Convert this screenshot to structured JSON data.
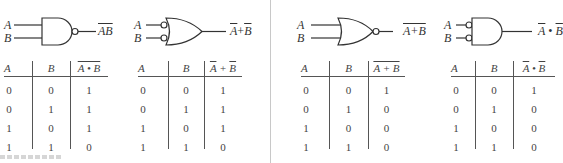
{
  "diagrams": [
    {
      "gate": "NAND",
      "input_a": "A",
      "input_b": "B",
      "output_expr": "AB",
      "output_style": "overline-whole",
      "table": {
        "headers": [
          "A",
          "B",
          "A • B"
        ],
        "rows": [
          [
            "0",
            "0",
            "1"
          ],
          [
            "0",
            "1",
            "1"
          ],
          [
            "1",
            "0",
            "1"
          ],
          [
            "1",
            "1",
            "0"
          ]
        ]
      }
    },
    {
      "gate": "OR with inverted inputs",
      "input_a": "A",
      "input_b": "B",
      "output_expr_parts": [
        "A",
        "+",
        "B"
      ],
      "output_style": "overline-each",
      "table": {
        "headers": [
          "A",
          "B",
          "A + B"
        ],
        "rows": [
          [
            "0",
            "0",
            "1"
          ],
          [
            "0",
            "1",
            "1"
          ],
          [
            "1",
            "0",
            "1"
          ],
          [
            "1",
            "1",
            "0"
          ]
        ]
      }
    },
    {
      "gate": "NOR",
      "input_a": "A",
      "input_b": "B",
      "output_expr": "A+B",
      "output_style": "overline-whole",
      "table": {
        "headers": [
          "A",
          "B",
          "A + B"
        ],
        "rows": [
          [
            "0",
            "0",
            "1"
          ],
          [
            "0",
            "1",
            "0"
          ],
          [
            "1",
            "0",
            "0"
          ],
          [
            "1",
            "1",
            "0"
          ]
        ]
      }
    },
    {
      "gate": "AND with inverted inputs",
      "input_a": "A",
      "input_b": "B",
      "output_expr_parts": [
        "A",
        "•",
        "B"
      ],
      "output_style": "overline-each",
      "table": {
        "headers": [
          "A",
          "B",
          "A • B"
        ],
        "rows": [
          [
            "0",
            "0",
            "1"
          ],
          [
            "0",
            "1",
            "0"
          ],
          [
            "1",
            "0",
            "0"
          ],
          [
            "1",
            "1",
            "0"
          ]
        ]
      }
    }
  ],
  "colors": {
    "line": "#333333",
    "divider": "#c8c8c8",
    "background": "#ffffff"
  }
}
